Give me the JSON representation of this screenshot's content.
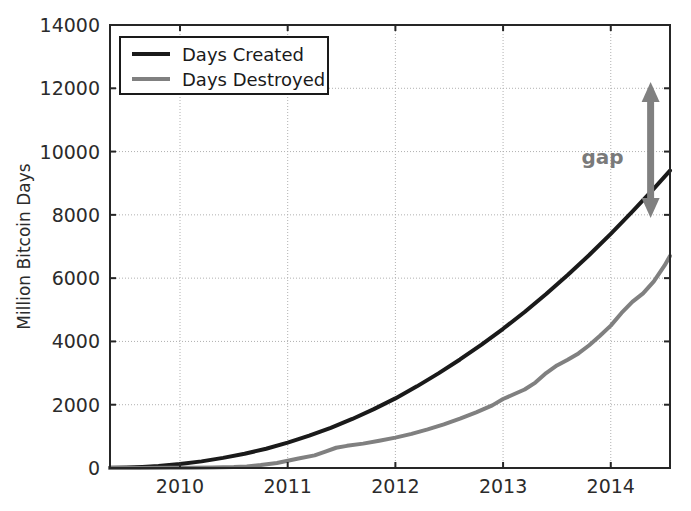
{
  "chart_data": {
    "type": "line",
    "title": "",
    "xlabel": "",
    "ylabel": "Million Bitcoin Days",
    "xlim": [
      2009.35,
      2014.55
    ],
    "ylim": [
      0,
      14000
    ],
    "grid": true,
    "legend_position": "upper left",
    "xticks": [
      2010,
      2011,
      2012,
      2013,
      2014
    ],
    "xtick_labels": [
      "2010",
      "2011",
      "2012",
      "2013",
      "2014"
    ],
    "yticks": [
      0,
      2000,
      4000,
      6000,
      8000,
      10000,
      12000,
      14000
    ],
    "ytick_labels": [
      "0",
      "2000",
      "4000",
      "6000",
      "8000",
      "10000",
      "12000",
      "14000"
    ],
    "series": [
      {
        "name": "Days Created",
        "color": "#1a1a1a",
        "x": [
          2009.35,
          2009.5,
          2009.65,
          2009.8,
          2010.0,
          2010.2,
          2010.4,
          2010.6,
          2010.8,
          2011.0,
          2011.2,
          2011.4,
          2011.6,
          2011.8,
          2012.0,
          2012.2,
          2012.4,
          2012.6,
          2012.8,
          2013.0,
          2013.2,
          2013.4,
          2013.6,
          2013.8,
          2014.0,
          2014.2,
          2014.4,
          2014.55
        ],
        "values": [
          5,
          15,
          35,
          65,
          125,
          210,
          320,
          450,
          610,
          800,
          1020,
          1270,
          1550,
          1860,
          2200,
          2580,
          2990,
          3430,
          3900,
          4400,
          4930,
          5500,
          6100,
          6730,
          7400,
          8100,
          8830,
          9400
        ]
      },
      {
        "name": "Days Destroyed",
        "color": "#808080",
        "x": [
          2009.35,
          2009.6,
          2009.9,
          2010.1,
          2010.3,
          2010.5,
          2010.62,
          2010.75,
          2010.9,
          2011.0,
          2011.1,
          2011.25,
          2011.35,
          2011.45,
          2011.55,
          2011.7,
          2011.85,
          2012.0,
          2012.15,
          2012.3,
          2012.45,
          2012.6,
          2012.75,
          2012.9,
          2013.0,
          2013.1,
          2013.2,
          2013.3,
          2013.4,
          2013.5,
          2013.6,
          2013.7,
          2013.8,
          2013.9,
          2014.0,
          2014.1,
          2014.2,
          2014.3,
          2014.4,
          2014.5,
          2014.55
        ],
        "values": [
          0,
          2,
          5,
          10,
          18,
          30,
          50,
          95,
          160,
          230,
          300,
          400,
          520,
          640,
          700,
          770,
          860,
          960,
          1080,
          1220,
          1380,
          1560,
          1760,
          1980,
          2180,
          2330,
          2480,
          2700,
          3000,
          3240,
          3420,
          3620,
          3880,
          4180,
          4500,
          4900,
          5250,
          5520,
          5900,
          6400,
          6700
        ]
      }
    ],
    "annotations": [
      {
        "name": "gap",
        "label": "gap",
        "type": "double-arrow",
        "color": "#808080",
        "x": 2014.37,
        "y_top": 12200,
        "y_bottom": 7900,
        "label_x": 2014.12,
        "label_y": 9600
      }
    ]
  },
  "legend": {
    "items": [
      {
        "label": "Days Created",
        "color": "#1a1a1a"
      },
      {
        "label": "Days Destroyed",
        "color": "#808080"
      }
    ]
  },
  "axes": {
    "ylabel": "Million Bitcoin Days"
  },
  "colors": {
    "created": "#1a1a1a",
    "destroyed": "#808080",
    "grid": "#b0b0b0",
    "axis": "#262626",
    "background": "#ffffff"
  }
}
